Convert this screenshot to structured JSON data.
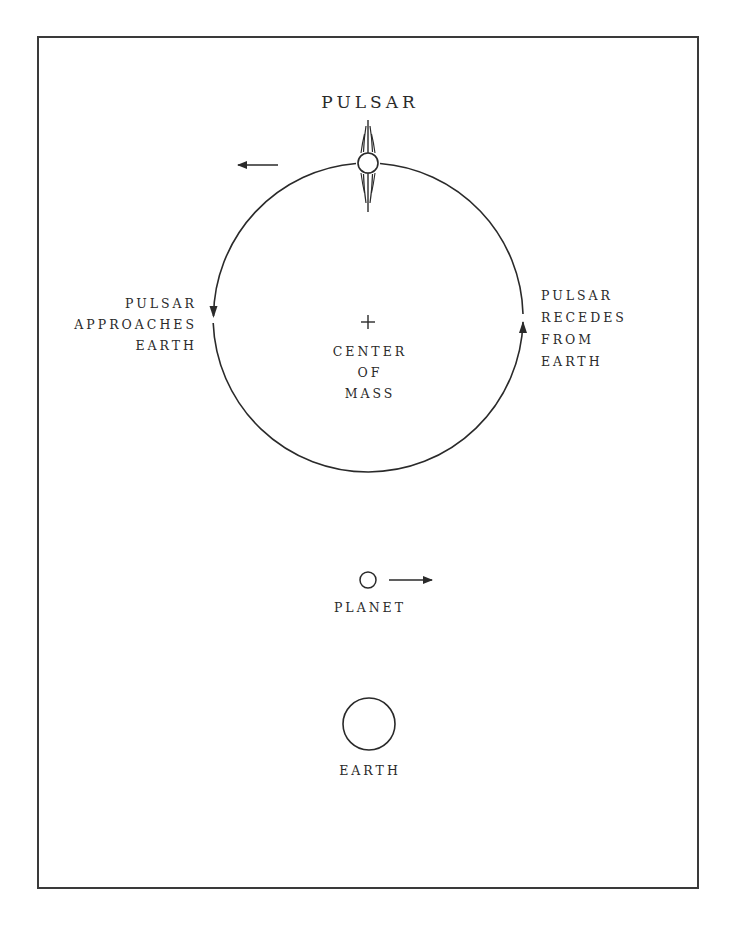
{
  "diagram": {
    "type": "orbital-schematic",
    "stroke_color": "#2a2a2a",
    "frame_color": "#3a3a3a",
    "background": "#ffffff",
    "labels": {
      "pulsar": "PULSAR",
      "approaches": [
        "PULSAR",
        "APPROACHES",
        "EARTH"
      ],
      "recedes": [
        "PULSAR",
        "RECEDES",
        "FROM",
        "EARTH"
      ],
      "center_of_mass": [
        "CENTER",
        "OF",
        "MASS"
      ],
      "planet": "PLANET",
      "earth": "EARTH"
    },
    "elements": {
      "orbit": {
        "cx": 368,
        "cy": 323,
        "r": 155
      },
      "pulsar_body": {
        "cx": 368,
        "cy": 163,
        "r": 10
      },
      "center_marker": "+",
      "planet_body": {
        "cx": 368,
        "cy": 580,
        "r": 8
      },
      "earth_body": {
        "cx": 369,
        "cy": 724,
        "r": 26
      }
    },
    "arrows": {
      "pulsar_velocity": "left",
      "planet_velocity": "right",
      "orbit_left_direction": "down",
      "orbit_right_direction": "up"
    }
  }
}
